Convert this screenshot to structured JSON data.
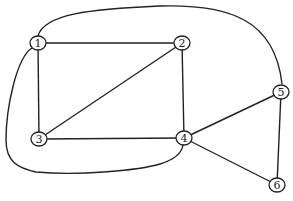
{
  "graph": {
    "nodes": [
      {
        "id": "1",
        "label": "1"
      },
      {
        "id": "2",
        "label": "2"
      },
      {
        "id": "3",
        "label": "3"
      },
      {
        "id": "4",
        "label": "4"
      },
      {
        "id": "5",
        "label": "5"
      },
      {
        "id": "6",
        "label": "6"
      }
    ],
    "edges": [
      {
        "from": "1",
        "to": "2",
        "style": "straight"
      },
      {
        "from": "1",
        "to": "3",
        "style": "straight"
      },
      {
        "from": "2",
        "to": "3",
        "style": "straight"
      },
      {
        "from": "2",
        "to": "4",
        "style": "straight"
      },
      {
        "from": "3",
        "to": "4",
        "style": "straight"
      },
      {
        "from": "4",
        "to": "5",
        "style": "straight"
      },
      {
        "from": "4",
        "to": "6",
        "style": "straight"
      },
      {
        "from": "5",
        "to": "6",
        "style": "straight"
      },
      {
        "from": "1",
        "to": "5",
        "style": "curved-top"
      },
      {
        "from": "1",
        "to": "4",
        "style": "curved-bottom-left"
      }
    ],
    "colors": {
      "stroke": "#222222",
      "background": "#ffffff"
    }
  }
}
